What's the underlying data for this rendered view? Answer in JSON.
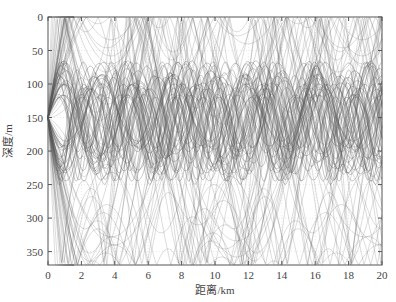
{
  "chart_data": {
    "type": "line",
    "title": "",
    "xlabel": "距离/km",
    "ylabel": "深度/m",
    "xlim": [
      0,
      20
    ],
    "ylim": [
      370,
      0
    ],
    "y_inverted": true,
    "x_ticks": [
      0,
      2,
      4,
      6,
      8,
      10,
      12,
      14,
      16,
      18,
      20
    ],
    "y_ticks": [
      0,
      50,
      100,
      150,
      200,
      250,
      300,
      350
    ],
    "grid": true,
    "legend": null,
    "source": {
      "range_km": 0,
      "depth_m": 150
    },
    "channel_axis_depth_m": 150,
    "ray_families": [
      {
        "name": "trapped-rays",
        "count": 45,
        "depth_range_m": [
          95,
          250
        ],
        "cycle_length_km": [
          2.2,
          4.5
        ]
      },
      {
        "name": "surface-bottom-rays",
        "count": 40,
        "depth_range_m": [
          0,
          370
        ],
        "cycle_length_km": [
          4.0,
          8.0
        ]
      }
    ],
    "line_color": "#555555"
  },
  "axes": {
    "xlabel": "距离/km",
    "ylabel": "深度/m"
  }
}
